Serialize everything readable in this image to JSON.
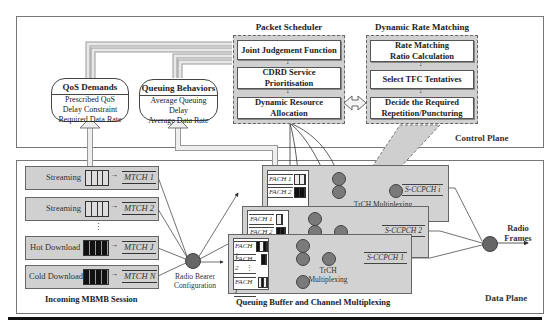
{
  "control_plane": {
    "label": "Control Plane",
    "qos_demands": {
      "title": "QoS Demands",
      "lines": [
        "Prescribed QoS",
        "Delay Constraint",
        "Required Data Rate"
      ]
    },
    "queuing_behaviors": {
      "title": "Queuing Behaviors",
      "lines": [
        "Average Queuing Delay",
        "Average Data Rate"
      ]
    },
    "packet_scheduler": {
      "title": "Packet Scheduler",
      "steps": [
        "Joint Judgement Function",
        "CDRD Service Prioritisation",
        "Dynamic Resource Allocation"
      ],
      "step_lines": [
        [
          "Joint Judgement Function"
        ],
        [
          "CDRD Service",
          "Prioritisation"
        ],
        [
          "Dynamic Resource",
          "Allocation"
        ]
      ]
    },
    "dynamic_rate_matching": {
      "title": "Dynamic Rate Matching",
      "step_lines": [
        [
          "Rate Matching",
          "Ratio Calculation"
        ],
        [
          "Select TFC Tentatives"
        ],
        [
          "Decide the Required",
          "Repetition/Puncturing"
        ]
      ]
    }
  },
  "data_plane": {
    "label": "Data Plane",
    "incoming_session": {
      "caption": "Incoming MBMB Session",
      "sessions": [
        {
          "name": "Streaming",
          "channel": "MTCH 1",
          "buffer": "light"
        },
        {
          "name": "Streaming",
          "channel": "MTCH 2",
          "buffer": "light"
        },
        {
          "name": "Hot Download",
          "channel": "MTCH J",
          "buffer": "dark"
        },
        {
          "name": "Cold Download",
          "channel": "MTCH N",
          "buffer": "dark"
        }
      ],
      "ellipsis": "⋮"
    },
    "radio_bearer": {
      "lines": [
        "Radio Bearer",
        "Configuration"
      ]
    },
    "queuing_buffer": {
      "caption": "Queuing Buffer and Channel Multiplexing",
      "cards": [
        {
          "fach": [
            "FACH 1",
            "FACH 2"
          ],
          "output": "S-CCPCH i",
          "mux_label": "TrCH Multiplexing"
        },
        {
          "fach": [
            "FACH 1",
            "FACH 2"
          ],
          "output": "S-CCPCH 2"
        },
        {
          "fach": [
            "FACH 1",
            "FACH 2",
            "FACH I"
          ],
          "output": "S-CCPCH 1",
          "mux_label_lines": [
            "TrCH",
            "Multiplexing"
          ]
        }
      ]
    },
    "radio_frames": {
      "lines": [
        "Radio",
        "Frames"
      ]
    }
  }
}
